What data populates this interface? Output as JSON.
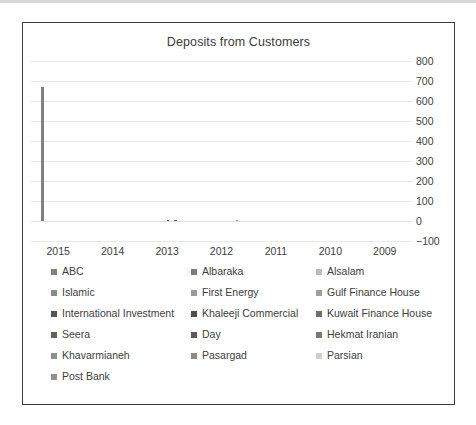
{
  "chart_data": {
    "type": "bar",
    "title": "Deposits from Customers",
    "xlabel": "",
    "ylabel": "",
    "categories": [
      "2015",
      "2014",
      "2013",
      "2012",
      "2011",
      "2010",
      "2009"
    ],
    "ylim": [
      -100,
      800
    ],
    "yticks": [
      800,
      700,
      600,
      500,
      400,
      300,
      200,
      100,
      0,
      -100
    ],
    "grid": true,
    "legend_position": "bottom",
    "series": [
      {
        "name": "ABC",
        "color": "#808080",
        "values": [
          670,
          0,
          0,
          0,
          0,
          0,
          0
        ]
      },
      {
        "name": "Albaraka",
        "color": "#7c7c7c",
        "values": [
          0,
          0,
          0,
          0,
          0,
          0,
          0
        ]
      },
      {
        "name": "Alsalam",
        "color": "#bdbdbd",
        "values": [
          0,
          0,
          0,
          0,
          0,
          0,
          0
        ]
      },
      {
        "name": "Islamic",
        "color": "#8a8a8a",
        "values": [
          0,
          0,
          0,
          0,
          0,
          0,
          0
        ]
      },
      {
        "name": "First Energy",
        "color": "#9a9a9a",
        "values": [
          0,
          0,
          0,
          0,
          0,
          0,
          0
        ]
      },
      {
        "name": "Gulf Finance House",
        "color": "#9e9e9e",
        "values": [
          0,
          0,
          0,
          0,
          0,
          0,
          0
        ]
      },
      {
        "name": "International Investment",
        "color": "#555555",
        "values": [
          0,
          0,
          0,
          0,
          0,
          0,
          0
        ]
      },
      {
        "name": "Khaleeji Commercial",
        "color": "#4f4f4f",
        "values": [
          0,
          0,
          4,
          0,
          0,
          0,
          0
        ]
      },
      {
        "name": "Kuwait Finance House",
        "color": "#6f6f6f",
        "values": [
          0,
          0,
          0,
          0,
          0,
          0,
          0
        ]
      },
      {
        "name": "Seera",
        "color": "#616161",
        "values": [
          0,
          0,
          0,
          0,
          0,
          0,
          0
        ]
      },
      {
        "name": "Day",
        "color": "#5a5a5a",
        "values": [
          0,
          0,
          7,
          0,
          0,
          0,
          0
        ]
      },
      {
        "name": "Hekmat Iranian",
        "color": "#787878",
        "values": [
          0,
          0,
          0,
          0,
          0,
          0,
          0
        ]
      },
      {
        "name": "Khavarmianeh",
        "color": "#8f8f8f",
        "values": [
          0,
          0,
          0,
          0,
          0,
          0,
          0
        ]
      },
      {
        "name": "Pasargad",
        "color": "#8c8c8c",
        "values": [
          0,
          0,
          0,
          5,
          0,
          0,
          0
        ]
      },
      {
        "name": "Parsian",
        "color": "#cfcfcf",
        "values": [
          0,
          0,
          0,
          0,
          0,
          0,
          0
        ]
      },
      {
        "name": "Post Bank",
        "color": "#909090",
        "values": [
          0,
          0,
          0,
          0,
          0,
          0,
          0
        ]
      }
    ]
  },
  "legend_rows": [
    [
      "ABC",
      "Albaraka",
      "Alsalam"
    ],
    [
      "Islamic",
      "First Energy",
      "Gulf Finance House"
    ],
    [
      "International Investment",
      "Khaleeji Commercial",
      "Kuwait Finance House"
    ],
    [
      "Seera",
      "Day",
      "Hekmat Iranian"
    ],
    [
      "Khavarmianeh",
      "Pasargad",
      "Parsian"
    ],
    [
      "Post Bank"
    ]
  ],
  "colors": {
    "frame_border": "#3a3a3a",
    "gridline": "#e9e9e9",
    "bar_primary": "#a6a6a6",
    "text": "#3d3d3d",
    "background": "#ffffff"
  }
}
